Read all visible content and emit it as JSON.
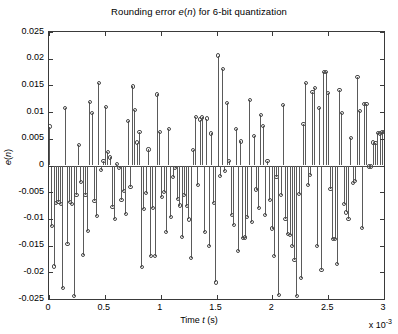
{
  "figure": {
    "title_prefix": "Rounding error ",
    "title_var1": "e",
    "title_mid": "(",
    "title_var2": "n",
    "title_suffix": ") for 6-bit quantization",
    "title_plain": "Rounding error e(n) for 6-bit quantization",
    "background": "#ffffff",
    "axis_color": "#3a3a3a",
    "stem_color": "#5a5a5a",
    "marker_color": "#4a4a4a"
  },
  "axes": {
    "xlabel_prefix": "Time ",
    "xlabel_var": "t",
    "xlabel_suffix": " (s)",
    "xlabel_plain": "Time t (s)",
    "ylabel_var": "e",
    "ylabel_paren_open": "(",
    "ylabel_var2": "n",
    "ylabel_paren_close": ")",
    "ylabel_plain": "e(n)",
    "x_multiplier_text": "x 10",
    "x_multiplier_exp": "-3",
    "xticks": [
      "0",
      "0.5",
      "1",
      "1.5",
      "2",
      "2.5",
      "3"
    ],
    "xtick_values": [
      0,
      0.5,
      1,
      1.5,
      2,
      2.5,
      3
    ],
    "yticks": [
      "0.025",
      "0.02",
      "0.015",
      "0.01",
      "0.005",
      "0",
      "-0.005",
      "-0.01",
      "-0.015",
      "-0.02",
      "-0.025"
    ],
    "ytick_values": [
      0.025,
      0.02,
      0.015,
      0.01,
      0.005,
      0,
      -0.005,
      -0.01,
      -0.015,
      -0.02,
      -0.025
    ],
    "xlim": [
      0,
      3
    ],
    "ylim": [
      -0.025,
      0.025
    ],
    "grid": false,
    "box": true,
    "tick_direction": "in"
  },
  "chart_data": {
    "type": "stem",
    "title": "Rounding error e(n) for 6-bit quantization",
    "xlabel": "Time t (s)",
    "ylabel": "e(n)",
    "x_scale_factor": 0.001,
    "xlim": [
      0,
      3
    ],
    "ylim": [
      -0.025,
      0.025
    ],
    "grid": false,
    "legend": null,
    "marker": "open-circle",
    "baseline": 0,
    "n_points": 150,
    "x": [
      0.0,
      0.0201,
      0.0403,
      0.0604,
      0.0805,
      0.1007,
      0.1208,
      0.1409,
      0.1611,
      0.1812,
      0.2013,
      0.2215,
      0.2416,
      0.2617,
      0.2819,
      0.302,
      0.3221,
      0.3423,
      0.3624,
      0.3826,
      0.4027,
      0.4228,
      0.443,
      0.4631,
      0.4832,
      0.5034,
      0.5235,
      0.5436,
      0.5638,
      0.5839,
      0.604,
      0.6242,
      0.6443,
      0.6644,
      0.6846,
      0.7047,
      0.7248,
      0.745,
      0.7651,
      0.7852,
      0.8054,
      0.8255,
      0.8456,
      0.8658,
      0.8859,
      0.906,
      0.9262,
      0.9463,
      0.9664,
      0.9866,
      1.0067,
      1.0268,
      1.047,
      1.0671,
      1.0872,
      1.1074,
      1.1275,
      1.1477,
      1.1678,
      1.1879,
      1.2081,
      1.2282,
      1.2483,
      1.2685,
      1.2886,
      1.3087,
      1.3289,
      1.349,
      1.3691,
      1.3893,
      1.4094,
      1.4295,
      1.4497,
      1.4698,
      1.4899,
      1.5101,
      1.5302,
      1.5503,
      1.5705,
      1.5906,
      1.6107,
      1.6309,
      1.651,
      1.6711,
      1.6913,
      1.7114,
      1.7315,
      1.7517,
      1.7718,
      1.7919,
      1.8121,
      1.8322,
      1.8523,
      1.8725,
      1.8926,
      1.9128,
      1.9329,
      1.953,
      1.9732,
      1.9933,
      2.0134,
      2.0336,
      2.0537,
      2.0738,
      2.094,
      2.1141,
      2.1342,
      2.1544,
      2.1745,
      2.1946,
      2.2148,
      2.2349,
      2.255,
      2.2752,
      2.2953,
      2.3154,
      2.3356,
      2.3557,
      2.3758,
      2.396,
      2.4161,
      2.4362,
      2.4564,
      2.4765,
      2.4966,
      2.5168,
      2.5369,
      2.557,
      2.5772,
      2.5973,
      2.6174,
      2.6376,
      2.6577,
      2.6779,
      2.698,
      2.7181,
      2.7383,
      2.7584,
      2.7785,
      2.7987,
      2.8188,
      2.8389,
      2.8591,
      2.8792,
      2.8993,
      2.9195,
      2.9396,
      2.9597,
      2.9799,
      3.0
    ],
    "y": [
      0.0073,
      -0.0114,
      -0.0189,
      -0.007,
      -0.0068,
      -0.0072,
      -0.023,
      0.0108,
      -0.0147,
      -0.0069,
      -0.0072,
      -0.0244,
      -0.0056,
      0.0039,
      -0.0031,
      -0.0168,
      -0.0055,
      -0.0122,
      0.0119,
      0.0099,
      -0.0066,
      -0.0094,
      0.0155,
      -0.0008,
      0.0009,
      0.011,
      0.0026,
      0.0015,
      -0.0078,
      -0.01,
      0.0003,
      -0.0004,
      -0.0064,
      -0.0048,
      -0.0091,
      0.0083,
      -0.0041,
      0.0148,
      0.0104,
      0.0043,
      0.0062,
      -0.019,
      -0.0082,
      -0.0051,
      0.003,
      -0.0169,
      -0.0079,
      -0.0169,
      0.0133,
      0.0063,
      -0.0059,
      -0.0049,
      -0.0125,
      0.0068,
      -0.0097,
      -0.0022,
      -0.0004,
      -0.0063,
      -0.0075,
      -0.0134,
      -0.0056,
      -0.0076,
      -0.0101,
      -0.0173,
      0.0029,
      0.0091,
      -0.0037,
      0.0086,
      0.009,
      -0.0125,
      0.0088,
      -0.015,
      0.006,
      -0.007,
      -0.0219,
      0.0206,
      -0.002,
      0.018,
      -0.001,
      0.0117,
      0.0008,
      -0.0093,
      -0.0112,
      0.0068,
      -0.016,
      0.0045,
      -0.0136,
      -0.0135,
      -0.0096,
      0.0123,
      -0.0106,
      0.0055,
      -0.0045,
      -0.0079,
      0.0095,
      0.0074,
      -0.0092,
      0.0008,
      -0.0064,
      -0.0118,
      -0.017,
      -0.0022,
      -0.0242,
      -0.0055,
      0.0113,
      -0.01,
      -0.0129,
      -0.013,
      -0.015,
      -0.0177,
      -0.0244,
      -0.0054,
      -0.021,
      0.0078,
      0.0155,
      -0.0037,
      -0.0018,
      0.0138,
      0.0145,
      -0.0151,
      0.0107,
      -0.0195,
      0.0175,
      0.0175,
      0.0135,
      -0.0044,
      -0.0137,
      -0.0137,
      -0.0184,
      0.0142,
      0.0098,
      -0.0072,
      -0.0088,
      -0.01,
      0.0051,
      -0.0033,
      -0.0029,
      0.0165,
      0.0102,
      -0.0117,
      0.0115,
      0.0115,
      -0.0002,
      -0.0002,
      0.0043,
      0.0042,
      0.0061,
      0.006,
      0.0062,
      0.0063
    ]
  }
}
